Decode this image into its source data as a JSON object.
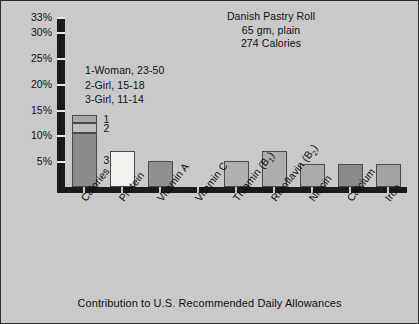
{
  "figure": {
    "background_color": "#c9c9c9",
    "border_color": "#2b2b2b",
    "footer": "Contribution to U.S. Recommended Daily Allowances"
  },
  "title_block": {
    "line1": "Danish Pastry Roll",
    "line2": "65 gm, plain",
    "line3": "274 Calories"
  },
  "legend": {
    "items": [
      {
        "key": "1",
        "label": "1-Woman, 23-50"
      },
      {
        "key": "2",
        "label": "2-Girl, 15-18"
      },
      {
        "key": "3",
        "label": "3-Girl, 11-14"
      }
    ]
  },
  "axis": {
    "y_ticks": [
      {
        "value": 5,
        "label": "5%"
      },
      {
        "value": 10,
        "label": "10%"
      },
      {
        "value": 15,
        "label": "15%"
      },
      {
        "value": 20,
        "label": "20%"
      },
      {
        "value": 25,
        "label": "25%"
      },
      {
        "value": 30,
        "label": "30%"
      },
      {
        "value": 33,
        "label": "33%"
      }
    ]
  },
  "chart_data": {
    "type": "bar",
    "title": "Danish Pastry Roll",
    "subtitle": "65 gm, plain — 274 Calories",
    "xlabel": "",
    "ylabel": "",
    "ylim": [
      0,
      33
    ],
    "grid": false,
    "legend_position": "upper-left-inside",
    "stacked_first_category": true,
    "categories": [
      "Calories",
      "Protein",
      "Vitamin A",
      "Vitamin C",
      "Thiamin (B1)",
      "Riboflavin (B2)",
      "Niacin",
      "Calcium",
      "Iron"
    ],
    "category_labels_html": [
      "Calories",
      "Protein",
      "Vitamin A",
      "Vitamin C",
      "Thiamin (B<sub>1</sub>)",
      "Riboflavin (B<sub>2</sub>)",
      "Niacin",
      "Calcium",
      "Iron"
    ],
    "values": [
      14,
      7,
      5,
      0,
      5,
      7,
      4.5,
      4.5,
      4.5
    ],
    "series": [
      {
        "name": "1-Woman, 23-50",
        "key": "1",
        "color": "#a8a8a8",
        "stack_segment_values": {
          "Calories": 1.5
        }
      },
      {
        "name": "2-Girl, 15-18",
        "key": "2",
        "color": "#bfbfbf",
        "stack_segment_values": {
          "Calories": 2.0
        }
      },
      {
        "name": "3-Girl, 11-14",
        "key": "3",
        "color": "#8b8b8b",
        "stack_segment_values": {
          "Calories": 10.5
        }
      }
    ],
    "bars": [
      {
        "category": "Calories",
        "value": 14,
        "color": "#8b8b8b",
        "stacked": true,
        "segments": [
          {
            "key": "3",
            "value": 10.5,
            "color": "#8b8b8b"
          },
          {
            "key": "2",
            "value": 2.0,
            "color": "#bfbfbf"
          },
          {
            "key": "1",
            "value": 1.5,
            "color": "#a8a8a8"
          }
        ]
      },
      {
        "category": "Protein",
        "value": 7,
        "color": "#f2f2ee",
        "stacked": false,
        "segments": []
      },
      {
        "category": "Vitamin A",
        "value": 5,
        "color": "#8f8f8f",
        "stacked": false,
        "segments": []
      },
      {
        "category": "Vitamin C",
        "value": 0,
        "color": "#a8a8a8",
        "stacked": false,
        "segments": []
      },
      {
        "category": "Thiamin (B1)",
        "value": 5,
        "color": "#b0b0b0",
        "stacked": false,
        "segments": []
      },
      {
        "category": "Riboflavin (B2)",
        "value": 7,
        "color": "#aeaeae",
        "stacked": false,
        "segments": []
      },
      {
        "category": "Niacin",
        "value": 4.5,
        "color": "#ababab",
        "stacked": false,
        "segments": []
      },
      {
        "category": "Calcium",
        "value": 4.5,
        "color": "#8a8a8a",
        "stacked": false,
        "segments": []
      },
      {
        "category": "Iron",
        "value": 4.5,
        "color": "#a3a3a3",
        "stacked": false,
        "segments": []
      }
    ]
  }
}
